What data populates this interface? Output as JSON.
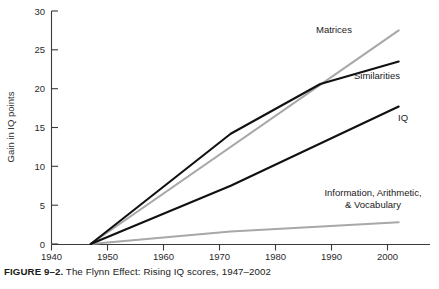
{
  "caption": {
    "figure_label": "FIGURE 9–2.",
    "text": " The Flynn Effect: Rising IQ scores, 1947–2002"
  },
  "chart_data": {
    "type": "line",
    "title": "",
    "xlabel": "",
    "ylabel": "Gain in IQ points",
    "xlim": [
      1940,
      2004
    ],
    "ylim": [
      0,
      30
    ],
    "grid": false,
    "legend_position": "inline-right-of-series",
    "xticks": [
      1940,
      1950,
      1960,
      1970,
      1980,
      1990,
      2000
    ],
    "xtick_labels": [
      "1940",
      "1950",
      "1960",
      "1970",
      "1980",
      "1990",
      "2000"
    ],
    "yticks": [
      0,
      5,
      10,
      15,
      20,
      25,
      30
    ],
    "ytick_labels": [
      "0",
      "5",
      "10",
      "15",
      "20",
      "25",
      "30"
    ],
    "series": [
      {
        "name": "Matrices",
        "color": "#a8a8a8",
        "label_text": "Matrices",
        "x": [
          1947,
          2002
        ],
        "values": [
          0,
          27.5
        ]
      },
      {
        "name": "Similarities",
        "color": "#111111",
        "label_text": "Similarities",
        "x": [
          1947,
          1972,
          1988,
          2002
        ],
        "values": [
          0,
          14.2,
          20.6,
          23.5
        ]
      },
      {
        "name": "IQ",
        "color": "#111111",
        "label_text": "IQ",
        "x": [
          1947,
          1972,
          2002
        ],
        "values": [
          0,
          7.5,
          17.7
        ]
      },
      {
        "name": "Information, Arithmetic, & Vocabulary",
        "color": "#a8a8a8",
        "label_text_line1": "Information, Arithmetic,",
        "label_text_line2": "& Vocabulary",
        "x": [
          1947,
          1972,
          2002
        ],
        "values": [
          0,
          1.6,
          2.8
        ]
      }
    ]
  }
}
